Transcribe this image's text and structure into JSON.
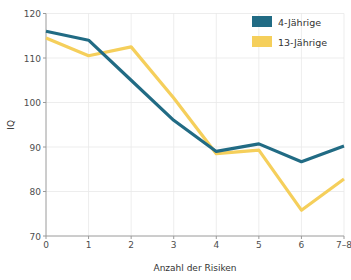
{
  "chart_data": {
    "type": "line",
    "title": "",
    "xlabel": "Anzahl der Risiken",
    "ylabel": "IQ",
    "categories": [
      "0",
      "1",
      "2",
      "3",
      "4",
      "5",
      "6",
      "7–8"
    ],
    "xticklabels": [
      "0",
      "1",
      "2",
      "3",
      "4",
      "5",
      "6",
      "7–8"
    ],
    "yticklabels": [
      "70",
      "80",
      "90",
      "100",
      "110",
      "120"
    ],
    "yticks": [
      70,
      80,
      90,
      100,
      110,
      120
    ],
    "ylim": [
      70,
      120
    ],
    "xlim": [
      0,
      7
    ],
    "grid": true,
    "legend_position": "top-right",
    "series": [
      {
        "name": "4-Jährige",
        "color": "#216b84",
        "values": [
          116.0,
          114.0,
          105.0,
          96.0,
          89.0,
          90.7,
          86.7,
          90.2
        ]
      },
      {
        "name": "13-Jährige",
        "color": "#f5cf5b",
        "values": [
          114.5,
          110.5,
          112.5,
          101.0,
          88.5,
          89.3,
          75.8,
          82.8
        ]
      }
    ]
  },
  "legend": {
    "items": [
      {
        "label": "4-Jährige",
        "color": "#216b84"
      },
      {
        "label": "13-Jährige",
        "color": "#f5cf5b"
      }
    ]
  },
  "axes": {
    "x_title": "Anzahl der Risiken",
    "y_title": "IQ"
  },
  "colors": {
    "series_1": "#216b84",
    "series_2": "#f5cf5b",
    "grid": "#e8e8e8",
    "axis": "#9a9a9a",
    "text": "#4d4d4d",
    "background": "#ffffff"
  }
}
